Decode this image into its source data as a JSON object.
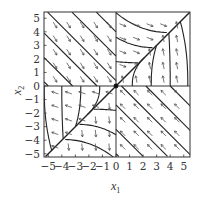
{
  "figure": {
    "type": "phase-portrait",
    "x_label": "x",
    "x_label_sub": "1",
    "y_label": "x",
    "y_label_sub": "2",
    "x_ticks": [
      "−5",
      "−4",
      "−3",
      "−2",
      "−1",
      "0",
      "1",
      "2",
      "3",
      "4",
      "5"
    ],
    "y_ticks": [
      "5",
      "4",
      "3",
      "2",
      "1",
      "0",
      "−1",
      "−2",
      "−3",
      "−4",
      "−5"
    ],
    "x_range": [
      -5.3,
      5.5
    ],
    "y_range": [
      -5.2,
      5.45
    ],
    "equilibrium": [
      0,
      0
    ],
    "colors": {
      "trajectory": "#222222",
      "arrow": "#555555",
      "frame": "#333333"
    }
  },
  "chart_data": {
    "type": "phase-portrait",
    "title": "",
    "xlabel": "x1",
    "ylabel": "x2",
    "xlim": [
      -5.3,
      5.5
    ],
    "ylim": [
      -5.2,
      5.45
    ],
    "xticks": [
      -5,
      -4,
      -3,
      -2,
      -1,
      0,
      1,
      2,
      3,
      4,
      5
    ],
    "yticks": [
      -5,
      -4,
      -3,
      -2,
      -1,
      0,
      1,
      2,
      3,
      4,
      5
    ],
    "grid": false,
    "axes_lines": [
      "x1=0",
      "x2=0"
    ],
    "invariant_line": "x2 = x1",
    "regions": [
      {
        "name": "upper-left",
        "trajectories": "straight lines slope -1",
        "flow": "down-right"
      },
      {
        "name": "lower-right",
        "trajectories": "straight lines slope -1",
        "flow": "up-left"
      },
      {
        "name": "upper-right above diagonal",
        "trajectories": "curves merging onto x2=x1",
        "flow": "right"
      },
      {
        "name": "upper-right below diagonal",
        "trajectories": "curves merging onto x2=x1",
        "flow": "up"
      },
      {
        "name": "lower-left left of diagonal",
        "trajectories": "curves merging onto x2=x1",
        "flow": "down"
      },
      {
        "name": "lower-left right of diagonal",
        "trajectories": "curves merging onto x2=x1",
        "flow": "left"
      }
    ]
  }
}
